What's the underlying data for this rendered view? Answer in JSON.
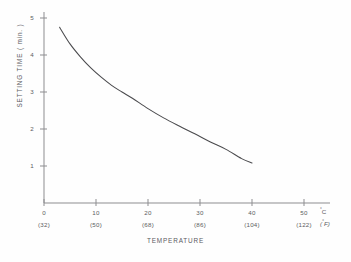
{
  "figure": {
    "background_color": "#fefefe",
    "line_color": "#4a4a4d",
    "axis_color": "#8d8d90",
    "text_color": "#5b5b5e"
  },
  "axes": {
    "y_title": "SETTING  TIME  ( min. )",
    "x_title": "TEMPERATURE",
    "x_unit_primary": "C",
    "x_unit_primary_degree": "°",
    "x_unit_secondary": "F",
    "x_unit_secondary_degree": "°",
    "y_ticks": [
      "1",
      "2",
      "3",
      "4",
      "5"
    ],
    "x_ticks_celsius": [
      "0",
      "10",
      "20",
      "30",
      "40",
      "50"
    ],
    "x_ticks_fahrenheit": [
      "(32)",
      "(50)",
      "(68)",
      "(86)",
      "(104)",
      "(122)"
    ]
  },
  "chart_data": {
    "type": "line",
    "title": "",
    "subtitle": "",
    "xlabel": "TEMPERATURE",
    "ylabel": "SETTING  TIME  ( min. )",
    "xlim": [
      0,
      52
    ],
    "ylim": [
      0,
      5.3
    ],
    "grid": false,
    "legend": "none",
    "x_unit": "°C",
    "x_secondary_unit": "°F",
    "x_tick_values": [
      0,
      10,
      20,
      30,
      40,
      50
    ],
    "x_tick_labels": [
      "0",
      "10",
      "20",
      "30",
      "40",
      "50"
    ],
    "x_secondary_tick_labels": [
      "(32)",
      "(50)",
      "(68)",
      "(86)",
      "(104)",
      "(122)"
    ],
    "y_tick_values": [
      1,
      2,
      3,
      4,
      5
    ],
    "y_tick_labels": [
      "1",
      "2",
      "3",
      "4",
      "5"
    ],
    "series": [
      {
        "name": "Setting time",
        "x": [
          3,
          5,
          7,
          9,
          11,
          13,
          15,
          17,
          20,
          23,
          26,
          29,
          32,
          35,
          38,
          40
        ],
        "values": [
          4.75,
          4.3,
          3.95,
          3.65,
          3.4,
          3.18,
          3.0,
          2.83,
          2.55,
          2.3,
          2.08,
          1.87,
          1.65,
          1.45,
          1.2,
          1.08
        ]
      }
    ]
  }
}
